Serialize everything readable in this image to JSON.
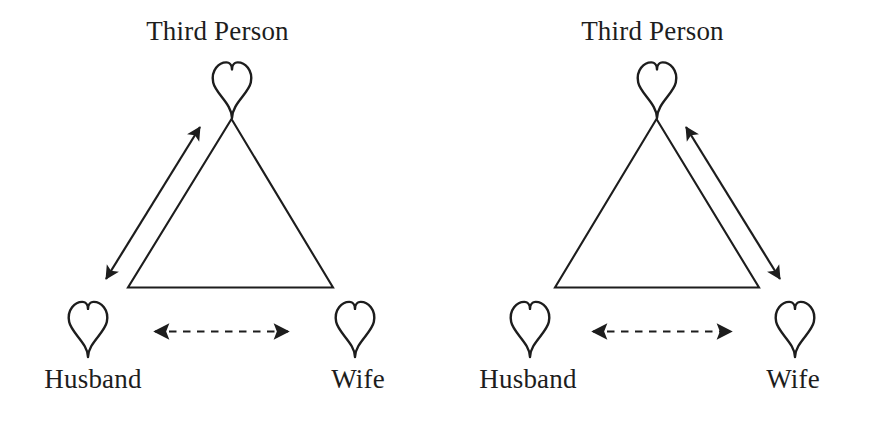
{
  "figure": {
    "background_color": "#ffffff",
    "stroke_color": "#1d1d1d",
    "width": 870,
    "height": 421
  },
  "diagrams": [
    {
      "id": "left",
      "nodes": {
        "top": {
          "label": "Third Person",
          "icon": "heart-icon"
        },
        "bottom_left": {
          "label": "Husband",
          "icon": "heart-icon"
        },
        "bottom_right": {
          "label": "Wife",
          "icon": "heart-icon"
        }
      },
      "shape": "triangle",
      "relations": [
        {
          "name": "husband-third-person-link",
          "from": "Husband",
          "to": "Third Person",
          "style": "solid",
          "arrow": "double",
          "side": "left"
        },
        {
          "name": "husband-wife-link",
          "from": "Husband",
          "to": "Wife",
          "style": "dashed",
          "arrow": "double",
          "side": "bottom"
        }
      ]
    },
    {
      "id": "right",
      "nodes": {
        "top": {
          "label": "Third Person",
          "icon": "heart-icon"
        },
        "bottom_left": {
          "label": "Husband",
          "icon": "heart-icon"
        },
        "bottom_right": {
          "label": "Wife",
          "icon": "heart-icon"
        }
      },
      "shape": "triangle",
      "relations": [
        {
          "name": "wife-third-person-link",
          "from": "Wife",
          "to": "Third Person",
          "style": "solid",
          "arrow": "double",
          "side": "right"
        },
        {
          "name": "husband-wife-link",
          "from": "Husband",
          "to": "Wife",
          "style": "dashed",
          "arrow": "double",
          "side": "bottom"
        }
      ]
    }
  ]
}
